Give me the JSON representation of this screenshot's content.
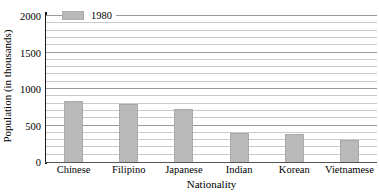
{
  "chart_data": {
    "type": "bar",
    "title": "",
    "xlabel": "Nationality",
    "ylabel": "Population (in thousands)",
    "categories": [
      "Chinese",
      "Filipino",
      "Japanese",
      "Indian",
      "Korean",
      "Vietnamese"
    ],
    "series": [
      {
        "name": "1980",
        "color": "#b9b9b9",
        "values": [
          830,
          800,
          730,
          400,
          390,
          300
        ]
      }
    ],
    "ylim": [
      0,
      2000
    ],
    "ytick_labels": [
      "0",
      "500",
      "1000",
      "1500",
      "2000"
    ],
    "ytick_values": [
      0,
      500,
      1000,
      1500,
      2000
    ],
    "minor_gridline_step": 100,
    "grid": true,
    "legend": {
      "position": "top-left-inside",
      "entries": [
        {
          "label": "1980",
          "swatch_color": "#b9b9b9"
        }
      ]
    },
    "axis_color": "#1a1a1a",
    "gridline_color": "#c9c9c9"
  }
}
